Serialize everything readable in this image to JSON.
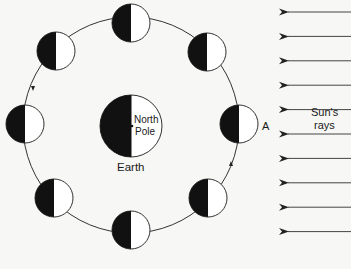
{
  "diagram": {
    "earth": {
      "label": "Earth",
      "pole_label_line1": "North",
      "pole_label_line2": "Pole",
      "dark_side": "left",
      "lit_side": "right"
    },
    "sun": {
      "label_line1": "Sun's",
      "label_line2": "rays",
      "direction": "right-to-left",
      "ray_count": 10
    },
    "orbit": {
      "direction": "counterclockwise",
      "direction_arrows": [
        "left-side-downward",
        "right-side-upward"
      ]
    },
    "moons": [
      {
        "id": "A",
        "position": "right",
        "label": "A",
        "dark_side": "left"
      },
      {
        "id": "m2",
        "position": "top-right",
        "label": "",
        "dark_side": "left"
      },
      {
        "id": "m3",
        "position": "top",
        "label": "",
        "dark_side": "left"
      },
      {
        "id": "m4",
        "position": "top-left",
        "label": "",
        "dark_side": "left"
      },
      {
        "id": "m5",
        "position": "left",
        "label": "",
        "dark_side": "left"
      },
      {
        "id": "m6",
        "position": "bottom-left",
        "label": "",
        "dark_side": "left"
      },
      {
        "id": "m7",
        "position": "bottom",
        "label": "",
        "dark_side": "left"
      },
      {
        "id": "m8",
        "position": "bottom-right",
        "label": "",
        "dark_side": "left"
      }
    ],
    "colors": {
      "dark": "#111111",
      "lit": "#ffffff",
      "line": "#333333"
    }
  }
}
